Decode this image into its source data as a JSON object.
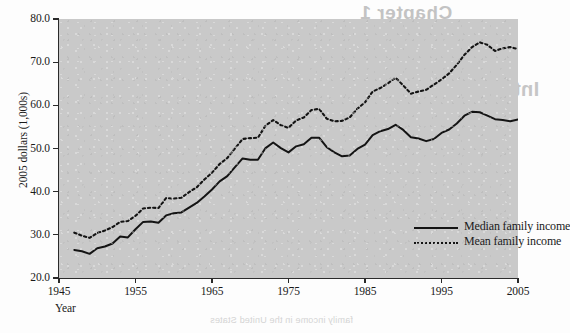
{
  "figure": {
    "background_color": "#c9c9c9",
    "line_color": "#141414"
  },
  "axes": {
    "y_title": "2005 dollars (1,000s)",
    "x_title": "Year",
    "y_ticks": [
      "80.0",
      "70.0",
      "60.0",
      "50.0",
      "40.0",
      "30.0",
      "20.0"
    ],
    "x_ticks": [
      "1945",
      "1955",
      "1965",
      "1975",
      "1985",
      "1995",
      "2005"
    ]
  },
  "legend": {
    "items": [
      {
        "label": "Median family income",
        "style": "solid"
      },
      {
        "label": "Mean family income",
        "style": "dotted"
      }
    ]
  },
  "ghost_text": {
    "chapter": "Chapter 1",
    "heading": "Introduction: Issues and Scope of Book",
    "line": "the distribution of income among families",
    "footnote": "family income in the United States"
  },
  "chart_data": {
    "type": "line",
    "title": "",
    "xlabel": "Year",
    "ylabel": "2005 dollars (1,000s)",
    "xlim": [
      1945,
      2005
    ],
    "ylim": [
      20.0,
      80.0
    ],
    "grid": false,
    "legend_position": "inside-lower-right",
    "x": [
      1947,
      1948,
      1949,
      1950,
      1951,
      1952,
      1953,
      1954,
      1955,
      1956,
      1957,
      1958,
      1959,
      1960,
      1961,
      1962,
      1963,
      1964,
      1965,
      1966,
      1967,
      1968,
      1969,
      1970,
      1971,
      1972,
      1973,
      1974,
      1975,
      1976,
      1977,
      1978,
      1979,
      1980,
      1981,
      1982,
      1983,
      1984,
      1985,
      1986,
      1987,
      1988,
      1989,
      1990,
      1991,
      1992,
      1993,
      1994,
      1995,
      1996,
      1997,
      1998,
      1999,
      2000,
      2001,
      2002,
      2003,
      2004,
      2005
    ],
    "series": [
      {
        "name": "Median family income",
        "style": "solid",
        "values": [
          26.5,
          26.2,
          25.6,
          26.9,
          27.3,
          28.0,
          29.6,
          29.4,
          31.3,
          33.0,
          33.1,
          32.8,
          34.5,
          35.0,
          35.2,
          36.3,
          37.4,
          38.9,
          40.5,
          42.4,
          43.6,
          45.7,
          47.7,
          47.4,
          47.4,
          50.1,
          51.4,
          50.1,
          49.1,
          50.5,
          51.0,
          52.5,
          52.5,
          50.3,
          49.1,
          48.2,
          48.4,
          49.9,
          50.9,
          53.1,
          54.0,
          54.5,
          55.5,
          54.3,
          52.6,
          52.3,
          51.7,
          52.2,
          53.6,
          54.4,
          55.8,
          57.6,
          58.5,
          58.4,
          57.6,
          56.8,
          56.6,
          56.3,
          56.7
        ]
      },
      {
        "name": "Mean family income",
        "style": "dotted",
        "values": [
          30.5,
          29.8,
          29.3,
          30.4,
          31.0,
          31.8,
          33.0,
          33.2,
          34.4,
          36.1,
          36.3,
          36.2,
          38.5,
          38.4,
          38.6,
          39.9,
          41.0,
          42.8,
          44.4,
          46.4,
          47.8,
          50.0,
          52.2,
          52.4,
          52.5,
          55.3,
          56.6,
          55.4,
          54.8,
          56.5,
          57.2,
          58.9,
          59.2,
          56.9,
          56.3,
          56.4,
          57.2,
          59.2,
          60.7,
          63.2,
          64.0,
          65.1,
          66.4,
          64.6,
          62.7,
          63.2,
          63.6,
          64.8,
          66.0,
          67.4,
          69.4,
          71.7,
          73.5,
          74.6,
          74.0,
          72.6,
          73.2,
          73.5,
          73.0
        ]
      }
    ]
  }
}
